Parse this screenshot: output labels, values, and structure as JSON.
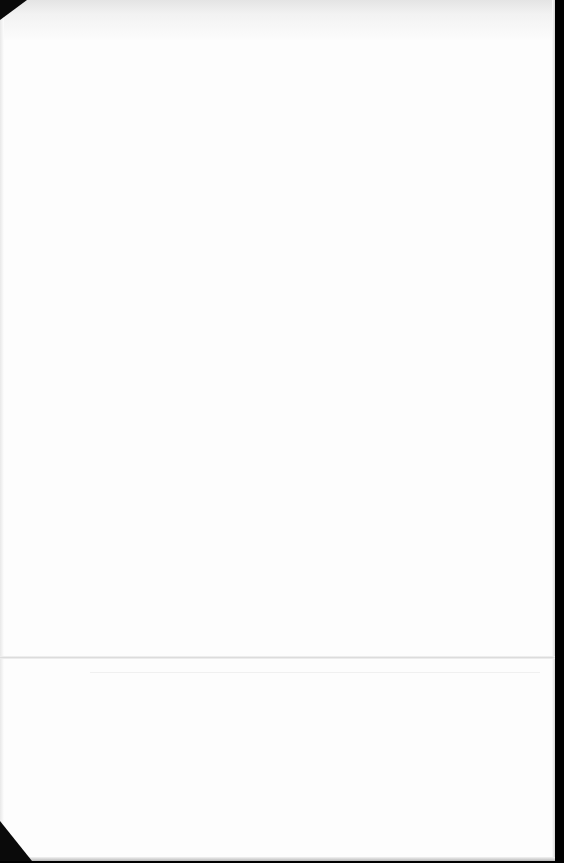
{
  "document": {
    "type": "scanned blank page",
    "background_color": "#fdfdfd",
    "scan_border_color": "#000000",
    "bleed_through_text": {
      "block_1": "",
      "block_2": "",
      "block_3": "",
      "block_4": "",
      "block_5": ""
    }
  }
}
